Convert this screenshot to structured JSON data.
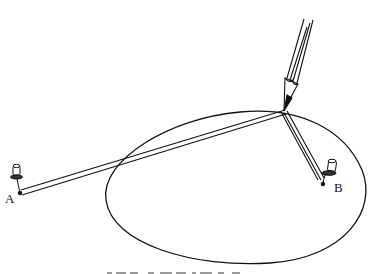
{
  "diagram": {
    "type": "gardener's ellipse construction (string-and-pins)",
    "labels": {
      "pin_a": "A",
      "pin_b": "B"
    },
    "caption_partial": "",
    "colors": {
      "ink": "#111111",
      "background": "#ffffff"
    },
    "elements": [
      "pin-a-tack",
      "pin-b-tack",
      "string-loop",
      "pencil",
      "ellipse-curve"
    ]
  }
}
